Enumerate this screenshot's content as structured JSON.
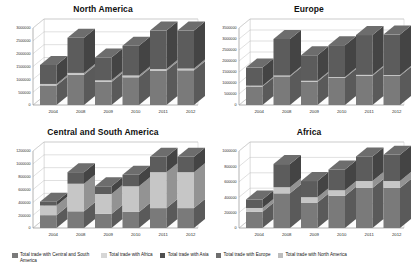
{
  "chart_data": [
    {
      "type": "bar",
      "stacked": true,
      "title": "North America",
      "xlabel": "",
      "ylabel": "",
      "categories": [
        "2004",
        "2008",
        "2009",
        "2010",
        "2011",
        "2012"
      ],
      "ylim": [
        0,
        3000000
      ],
      "yticks": [
        0,
        500000,
        1000000,
        1500000,
        2000000,
        2500000,
        3000000
      ],
      "ytick_labels": [
        "0",
        "500000",
        "1000000",
        "1500000",
        "2000000",
        "2500000",
        "3000000"
      ],
      "grid": true,
      "series": [
        {
          "name": "Total trade with Central and South America",
          "color": "#7a7a7a",
          "values": [
            760000,
            1180000,
            900000,
            1080000,
            1330000,
            1350000
          ]
        },
        {
          "name": "Total trade with Africa",
          "color": "#c6c6c6",
          "values": [
            60000,
            70000,
            60000,
            70000,
            70000,
            70000
          ]
        },
        {
          "name": "Total trade with Asia",
          "color": "#5c5c5c",
          "values": [
            740000,
            1370000,
            890000,
            1160000,
            1500000,
            1480000
          ]
        }
      ],
      "totals": [
        1560000,
        2620000,
        1850000,
        2310000,
        2900000,
        2900000
      ]
    },
    {
      "type": "bar",
      "stacked": true,
      "title": "Europe",
      "xlabel": "",
      "ylabel": "",
      "categories": [
        "2004",
        "2008",
        "2009",
        "2010",
        "2011",
        "2012"
      ],
      "ylim": [
        0,
        3500000
      ],
      "yticks": [
        0,
        500000,
        1000000,
        1500000,
        2000000,
        2500000,
        3000000,
        3500000
      ],
      "ytick_labels": [
        "0",
        "500000",
        "1000000",
        "1500000",
        "2000000",
        "2500000",
        "3000000",
        "3500000"
      ],
      "grid": true,
      "series": [
        {
          "name": "Total trade with Central and South America",
          "color": "#7a7a7a",
          "values": [
            840000,
            1300000,
            1060000,
            1230000,
            1330000,
            1320000
          ]
        },
        {
          "name": "Total trade with Africa",
          "color": "#c6c6c6",
          "values": [
            40000,
            40000,
            40000,
            40000,
            40000,
            40000
          ]
        },
        {
          "name": "Total trade with Asia",
          "color": "#5c5c5c",
          "values": [
            820000,
            1660000,
            1160000,
            1450000,
            1810000,
            1840000
          ]
        }
      ],
      "totals": [
        1700000,
        3000000,
        2260000,
        2720000,
        3180000,
        3200000
      ]
    },
    {
      "type": "bar",
      "stacked": true,
      "title": "Central and South America",
      "xlabel": "",
      "ylabel": "",
      "categories": [
        "2004",
        "2008",
        "2009",
        "2010",
        "2011",
        "2012"
      ],
      "ylim": [
        0,
        1200000
      ],
      "yticks": [
        0,
        200000,
        400000,
        600000,
        800000,
        1000000,
        1200000
      ],
      "ytick_labels": [
        "0",
        "200000",
        "400000",
        "600000",
        "800000",
        "1000000",
        "1200000"
      ],
      "grid": true,
      "series": [
        {
          "name": "Total trade with Central and South America",
          "color": "#7a7a7a",
          "values": [
            200000,
            260000,
            220000,
            250000,
            310000,
            310000
          ]
        },
        {
          "name": "Total trade with Africa",
          "color": "#c6c6c6",
          "values": [
            150000,
            430000,
            310000,
            400000,
            560000,
            560000
          ]
        },
        {
          "name": "Total trade with Asia",
          "color": "#5c5c5c",
          "values": [
            60000,
            180000,
            120000,
            180000,
            240000,
            240000
          ]
        }
      ],
      "totals": [
        410000,
        870000,
        650000,
        830000,
        1110000,
        1110000
      ]
    },
    {
      "type": "bar",
      "stacked": true,
      "title": "Africa",
      "xlabel": "",
      "ylabel": "",
      "categories": [
        "2004",
        "2008",
        "2009",
        "2010",
        "2011",
        "2012"
      ],
      "ylim": [
        0,
        1000000
      ],
      "yticks": [
        0,
        200000,
        400000,
        600000,
        800000,
        1000000
      ],
      "ytick_labels": [
        "0",
        "200000",
        "400000",
        "600000",
        "800000",
        "1000000"
      ],
      "grid": true,
      "series": [
        {
          "name": "Total trade with Central and South America",
          "color": "#7a7a7a",
          "values": [
            210000,
            450000,
            330000,
            420000,
            520000,
            520000
          ]
        },
        {
          "name": "Total trade with Africa",
          "color": "#c6c6c6",
          "values": [
            50000,
            80000,
            70000,
            70000,
            90000,
            90000
          ]
        },
        {
          "name": "Total trade with Asia",
          "color": "#5c5c5c",
          "values": [
            110000,
            300000,
            210000,
            270000,
            320000,
            340000
          ]
        }
      ],
      "totals": [
        370000,
        830000,
        610000,
        760000,
        930000,
        950000
      ]
    }
  ],
  "legend": {
    "position": "bottom",
    "items": [
      {
        "label": "Total trade with Central and South America",
        "color": "#7a7a7a"
      },
      {
        "label": "Total trade with Africa",
        "color": "#d6d6d6"
      },
      {
        "label": "Total trade with Asia",
        "color": "#4f4f4f"
      },
      {
        "label": "Total trade with Europe",
        "color": "#6e6e6e"
      },
      {
        "label": "Total trade with North America",
        "color": "#bdbdbd"
      }
    ]
  }
}
